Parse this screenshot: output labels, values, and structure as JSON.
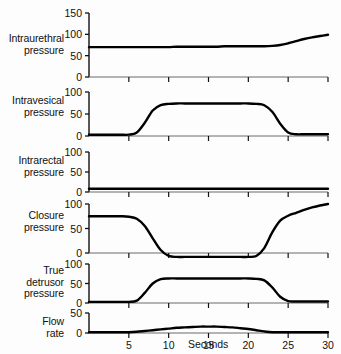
{
  "chart_data": {
    "type": "line",
    "title": "",
    "subtitle": "",
    "xlabel": "Seconds",
    "ylabel": "",
    "grid": false,
    "legend": "none",
    "x": [
      0,
      1,
      2,
      3,
      4,
      5,
      6,
      7,
      8,
      9,
      10,
      11,
      12,
      13,
      14,
      15,
      16,
      17,
      18,
      19,
      20,
      21,
      22,
      23,
      24,
      25,
      26,
      27,
      28,
      29,
      30
    ],
    "xlim": [
      0,
      30
    ],
    "xticks": [
      0,
      5,
      10,
      15,
      20,
      25,
      30
    ],
    "xticklabels": [
      "",
      "5",
      "10",
      "15",
      "20",
      "25",
      "30"
    ],
    "panels": [
      {
        "id": "intraurethral-pressure",
        "label_lines": [
          "Intraurethral",
          "pressure"
        ],
        "ylim": [
          0,
          150
        ],
        "yticks": [
          0,
          50,
          100,
          150
        ],
        "yticklabels": [
          "0",
          "50",
          "100",
          "150"
        ],
        "values": [
          70,
          70,
          70,
          70,
          70,
          70,
          70,
          70,
          70,
          70,
          70,
          71,
          71,
          71,
          71,
          71,
          71,
          72,
          72,
          72,
          72,
          72,
          72,
          73,
          75,
          79,
          84,
          89,
          93,
          96,
          99
        ]
      },
      {
        "id": "intravesical-pressure",
        "label_lines": [
          "Intravesical",
          "pressure"
        ],
        "ylim": [
          0,
          100
        ],
        "yticks": [
          0,
          50,
          100
        ],
        "yticklabels": [
          "0",
          "50",
          "100"
        ],
        "values": [
          3,
          3,
          3,
          3,
          3,
          3,
          8,
          30,
          58,
          70,
          73,
          74,
          74,
          74,
          74,
          74,
          74,
          74,
          74,
          74,
          74,
          73,
          70,
          55,
          28,
          8,
          4,
          4,
          4,
          4,
          4
        ]
      },
      {
        "id": "intrarectal-pressure",
        "label_lines": [
          "Intrarectal",
          "pressure"
        ],
        "ylim": [
          0,
          100
        ],
        "yticks": [
          0,
          50,
          100
        ],
        "yticklabels": [
          "0",
          "50",
          "100"
        ],
        "values": [
          8,
          8,
          8,
          8,
          8,
          8,
          8,
          8,
          8,
          8,
          8,
          8,
          8,
          8,
          8,
          8,
          8,
          8,
          8,
          8,
          8,
          8,
          8,
          8,
          8,
          8,
          8,
          8,
          8,
          8,
          8
        ]
      },
      {
        "id": "closure-pressure",
        "label_lines": [
          "Closure",
          "pressure"
        ],
        "ylim": [
          -20,
          100
        ],
        "yticks": [
          0,
          50,
          100
        ],
        "yticklabels": [
          "0",
          "50",
          "100"
        ],
        "values": [
          75,
          75,
          75,
          75,
          75,
          74,
          70,
          55,
          30,
          6,
          -6,
          -8,
          -8,
          -8,
          -8,
          -8,
          -8,
          -8,
          -8,
          -8,
          -8,
          -6,
          10,
          42,
          66,
          76,
          82,
          88,
          93,
          97,
          100
        ]
      },
      {
        "id": "true-detrusor-pressure",
        "label_lines": [
          "True",
          "detrusor",
          "pressure"
        ],
        "ylim": [
          0,
          100
        ],
        "yticks": [
          0,
          50,
          100
        ],
        "yticklabels": [
          "0",
          "50",
          "100"
        ],
        "values": [
          3,
          3,
          3,
          3,
          3,
          3,
          6,
          26,
          50,
          61,
          63,
          63,
          63,
          63,
          63,
          63,
          63,
          63,
          63,
          63,
          63,
          62,
          58,
          40,
          16,
          5,
          4,
          4,
          4,
          4,
          4
        ]
      },
      {
        "id": "flow-rate",
        "label_lines": [
          "Flow",
          "rate"
        ],
        "ylim": [
          0,
          50
        ],
        "yticks": [
          0,
          50
        ],
        "yticklabels": [
          "0",
          "50"
        ],
        "values": [
          2,
          2,
          2,
          2,
          2,
          2,
          3,
          5,
          7,
          9,
          11,
          13,
          14,
          15,
          16,
          16,
          16,
          15,
          14,
          12,
          10,
          7,
          4,
          2,
          2,
          2,
          2,
          2,
          2,
          2,
          2
        ]
      }
    ]
  }
}
